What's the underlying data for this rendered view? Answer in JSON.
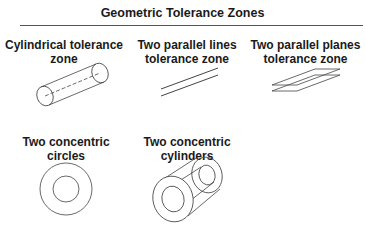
{
  "title": "Geometric Tolerance Zones",
  "zones": [
    {
      "name": "cylindrical",
      "label_line1": "Cylindrical tolerance",
      "label_line2": "zone"
    },
    {
      "name": "parallel-lines",
      "label_line1": "Two parallel lines",
      "label_line2": "tolerance zone"
    },
    {
      "name": "parallel-planes",
      "label_line1": "Two parallel planes",
      "label_line2": "tolerance zone"
    },
    {
      "name": "concentric-circles",
      "label_line1": "Two concentric",
      "label_line2": "circles"
    },
    {
      "name": "concentric-cylinders",
      "label_line1": "Two concentric",
      "label_line2": "cylinders"
    }
  ],
  "colors": {
    "stroke": "#444444",
    "text": "#1a1a1a"
  }
}
